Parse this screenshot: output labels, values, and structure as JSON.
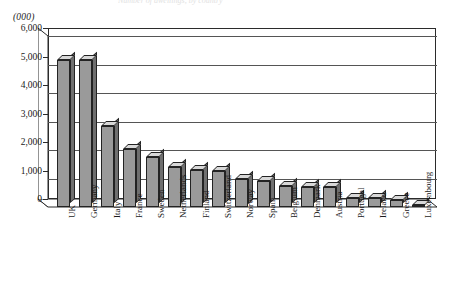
{
  "ghost_title": "Number of dwellings, by country",
  "units_label": "(000)",
  "chart_data": {
    "type": "bar",
    "title": "",
    "xlabel": "",
    "ylabel": "(000)",
    "ylim": [
      0,
      6000
    ],
    "grid": true,
    "legend": "none",
    "ytick_labels": [
      "6,000",
      "5,000",
      "4,000",
      "3,000",
      "2,000",
      "1,000",
      "0"
    ],
    "ytick_values": [
      6000,
      5000,
      4000,
      3000,
      2000,
      1000,
      0
    ],
    "categories": [
      "UK",
      "Germany",
      "Italy",
      "France",
      "Sweden",
      "Netherlands",
      "Finland",
      "Switzerland",
      "Norway",
      "Spain",
      "Belgium",
      "Denmark",
      "Austria",
      "Portugal",
      "Ireland",
      "Greece",
      "Luxembourg"
    ],
    "values": [
      5150,
      5150,
      2850,
      2050,
      1750,
      1400,
      1300,
      1250,
      1000,
      900,
      750,
      700,
      700,
      300,
      300,
      250,
      50
    ],
    "bar_style": "3d-column",
    "colors": {
      "bar_front": "#9a9a9a",
      "bar_top": "#d8d8d8",
      "bar_side": "#6f6f6f",
      "outline": "#232323",
      "gridline": "#555555",
      "background": "#ffffff"
    }
  }
}
